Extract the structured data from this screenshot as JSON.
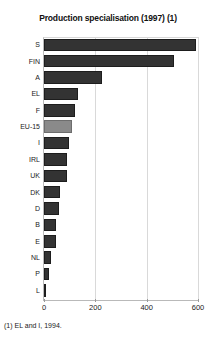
{
  "chart_data": {
    "type": "bar",
    "orientation": "horizontal",
    "title": "Production specialisation (1997) (1)",
    "xlabel": "",
    "ylabel": "",
    "categories": [
      "S",
      "FIN",
      "A",
      "EL",
      "F",
      "EU-15",
      "I",
      "IRL",
      "UK",
      "DK",
      "D",
      "B",
      "E",
      "NL",
      "P",
      "L"
    ],
    "values": [
      592,
      506,
      226,
      132,
      120,
      109,
      97,
      89,
      89,
      62,
      58,
      47,
      47,
      27,
      19,
      5
    ],
    "highlight_category": "EU-15",
    "xlim": [
      0,
      600
    ],
    "xticks": [
      0,
      200,
      400,
      600
    ],
    "xtick_labels": [
      "0",
      "200",
      "400",
      "600"
    ],
    "grid": "vertical",
    "legend": "none",
    "bar_color": "#333333",
    "highlight_color": "#8a8a8a"
  },
  "footnote": "(1) EL and I, 1994."
}
